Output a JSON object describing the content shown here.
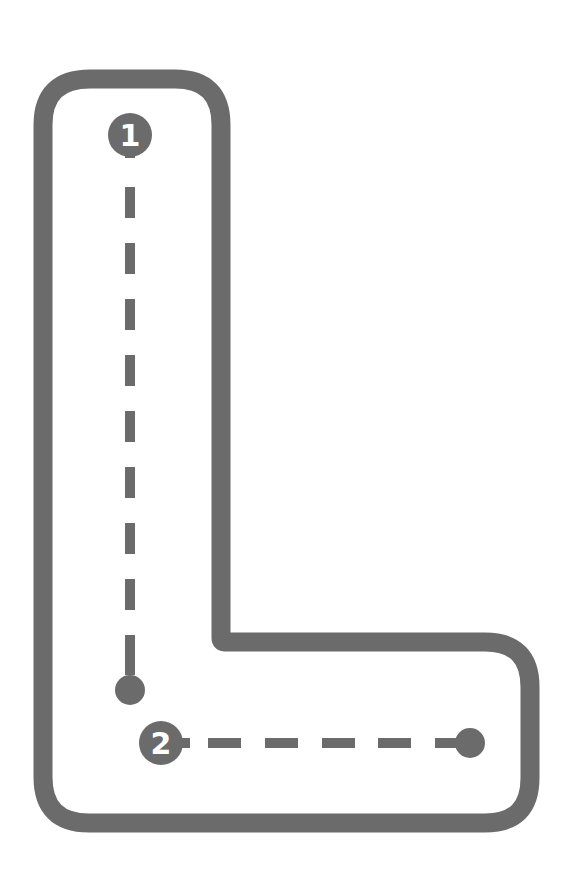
{
  "worksheet": {
    "letter": "L",
    "ink_color": "#6b6b6b",
    "background_color": "#ffffff",
    "strokes": [
      {
        "number": "1",
        "direction": "down"
      },
      {
        "number": "2",
        "direction": "right"
      }
    ]
  }
}
